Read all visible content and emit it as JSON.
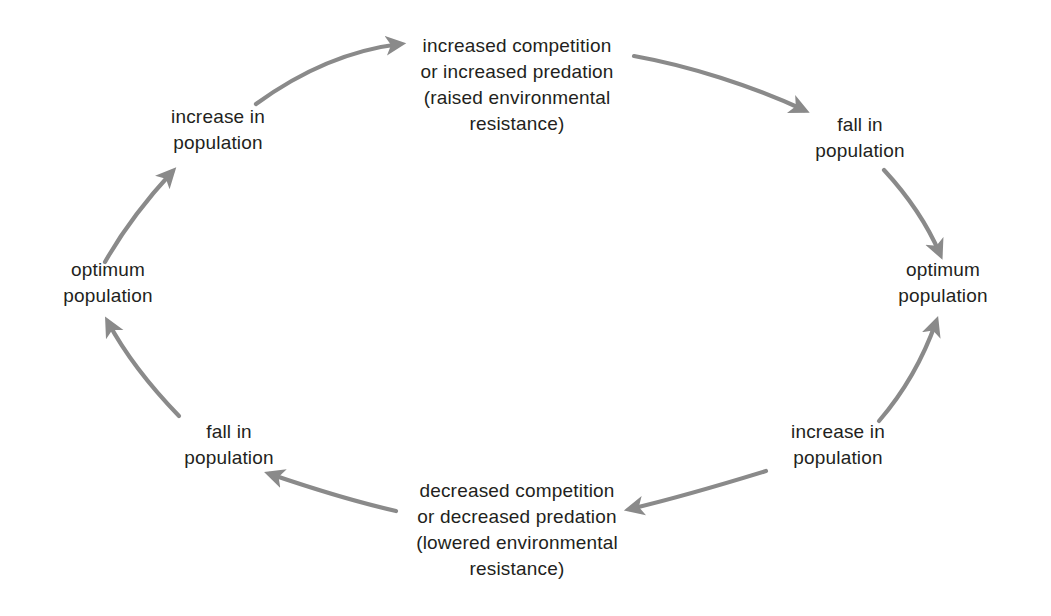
{
  "diagram": {
    "background_color": "#ffffff",
    "text_color": "#231f20",
    "arrow_color": "#8a8a8a",
    "nodes": [
      {
        "id": "optimum-population-left",
        "label": "optimum\npopulation",
        "x": 108,
        "y": 283
      },
      {
        "id": "increase-in-population-upper-left",
        "label": "increase in\npopulation",
        "x": 218,
        "y": 130
      },
      {
        "id": "increased-competition",
        "label": "increased competition\nor increased predation\n(raised environmental\nresistance)",
        "x": 517,
        "y": 85
      },
      {
        "id": "fall-in-population-upper-right",
        "label": "fall in\npopulation",
        "x": 860,
        "y": 138
      },
      {
        "id": "optimum-population-right",
        "label": "optimum\npopulation",
        "x": 943,
        "y": 283
      },
      {
        "id": "increase-in-population-lower-right",
        "label": "increase in\npopulation",
        "x": 838,
        "y": 445
      },
      {
        "id": "decreased-competition",
        "label": "decreased competition\nor decreased predation\n(lowered environmental\nresistance)",
        "x": 517,
        "y": 530
      },
      {
        "id": "fall-in-population-lower-left",
        "label": "fall in\npopulation",
        "x": 229,
        "y": 445
      }
    ],
    "arrows": [
      {
        "id": "arrow-optimum-left-to-increase",
        "from": "optimum-population-left",
        "to": "increase-in-population-upper-left",
        "path": "M 105 262 C 122 232 148 198 172 172"
      },
      {
        "id": "arrow-increase-to-increased-competition",
        "from": "increase-in-population-upper-left",
        "to": "increased-competition",
        "path": "M 256 104 C 300 72 350 50 400 44"
      },
      {
        "id": "arrow-increased-competition-to-fall",
        "from": "increased-competition",
        "to": "fall-in-population-upper-right",
        "path": "M 634 56 C 690 66 752 86 804 110"
      },
      {
        "id": "arrow-fall-to-optimum-right",
        "from": "fall-in-population-upper-right",
        "to": "optimum-population-right",
        "path": "M 884 170 C 908 196 928 226 940 254"
      },
      {
        "id": "arrow-optimum-right-to-increase",
        "from": "optimum-population-right",
        "to": "increase-in-population-lower-right",
        "path": "M 879 421 C 904 392 924 356 936 322"
      },
      {
        "id": "arrow-increase-to-decreased-competition",
        "from": "increase-in-population-lower-right",
        "to": "decreased-competition",
        "path": "M 766 471 C 714 487 664 501 630 509"
      },
      {
        "id": "arrow-decreased-competition-to-fall",
        "from": "decreased-competition",
        "to": "fall-in-population-lower-left",
        "path": "M 396 511 C 352 501 308 487 270 474"
      },
      {
        "id": "arrow-fall-to-optimum-left",
        "from": "fall-in-population-lower-left",
        "to": "optimum-population-left",
        "path": "M 179 416 C 150 386 124 352 108 322"
      }
    ]
  }
}
